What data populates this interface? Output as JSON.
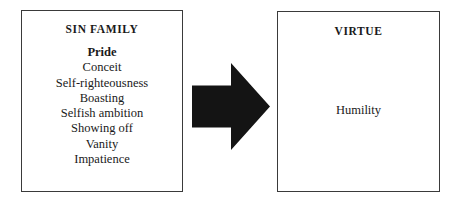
{
  "diagram": {
    "background_color": "#ffffff",
    "border_color": "#3a3a3a",
    "arrow_color": "#141414",
    "text_color": "#1a1a1a"
  },
  "sin_panel": {
    "heading": "SIN FAMILY",
    "items": [
      {
        "label": "Pride",
        "emphasis": true
      },
      {
        "label": "Conceit",
        "emphasis": false
      },
      {
        "label": "Self-righteousness",
        "emphasis": false
      },
      {
        "label": "Boasting",
        "emphasis": false
      },
      {
        "label": "Selfish ambition",
        "emphasis": false
      },
      {
        "label": "Showing off",
        "emphasis": false
      },
      {
        "label": "Vanity",
        "emphasis": false
      },
      {
        "label": "Impatience",
        "emphasis": false
      }
    ]
  },
  "arrow": {
    "icon": "arrow-right-icon",
    "direction": "right"
  },
  "virtue_panel": {
    "heading": "VIRTUE",
    "items": [
      {
        "label": "Humility"
      }
    ]
  }
}
